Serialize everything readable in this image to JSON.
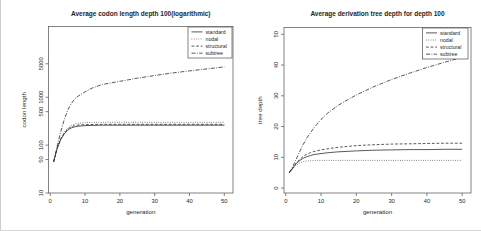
{
  "colors": {
    "line": "#2f2f2f",
    "box": "#5a5a5a",
    "text": "#1f1f1f",
    "background": "#ffffff",
    "frame": "#cccccc"
  },
  "chart_data": [
    {
      "type": "line",
      "title": "Average codon length depth 100(logarithmic)",
      "xlabel": "generation",
      "ylabel": "codon length",
      "x_ticks": [
        0,
        10,
        20,
        30,
        40,
        50
      ],
      "y_ticks": [
        10,
        50,
        100,
        500,
        1000,
        5000
      ],
      "xlim": [
        -0.5,
        52.5
      ],
      "ylim": [
        10,
        30000
      ],
      "y_scale": "log",
      "grid": false,
      "legend_position": "top-right",
      "legend": [
        {
          "label": "standard",
          "linestyle": "solid"
        },
        {
          "label": "nodal",
          "linestyle": "dotted"
        },
        {
          "label": "structural",
          "linestyle": "dashed"
        },
        {
          "label": "subtree",
          "linestyle": "dashdot"
        }
      ],
      "x": [
        1,
        2,
        3,
        4,
        5,
        6,
        7,
        8,
        10,
        12,
        15,
        20,
        25,
        30,
        35,
        40,
        45,
        50
      ],
      "series": [
        {
          "name": "standard",
          "linestyle": "solid",
          "values": [
            45,
            85,
            130,
            170,
            205,
            228,
            240,
            248,
            255,
            258,
            260,
            260,
            260,
            260,
            260,
            260,
            260,
            260
          ]
        },
        {
          "name": "nodal",
          "linestyle": "dotted",
          "values": [
            45,
            88,
            140,
            185,
            225,
            255,
            275,
            285,
            295,
            298,
            300,
            300,
            300,
            300,
            300,
            300,
            300,
            300
          ]
        },
        {
          "name": "structural",
          "linestyle": "dashed",
          "values": [
            45,
            87,
            135,
            178,
            215,
            240,
            255,
            262,
            268,
            270,
            272,
            272,
            272,
            272,
            272,
            272,
            272,
            272
          ]
        },
        {
          "name": "subtree",
          "linestyle": "dashdot",
          "values": [
            45,
            95,
            190,
            340,
            530,
            730,
            915,
            1050,
            1300,
            1550,
            1850,
            2150,
            2500,
            2850,
            3200,
            3550,
            3900,
            4300
          ]
        }
      ]
    },
    {
      "type": "line",
      "title": "Average derivation tree depth for depth 100",
      "xlabel": "generation",
      "ylabel": "tree depth",
      "x_ticks": [
        0,
        10,
        20,
        30,
        40,
        50
      ],
      "y_ticks": [
        0,
        10,
        20,
        30,
        40,
        50
      ],
      "xlim": [
        -0.5,
        52.5
      ],
      "ylim": [
        -1.6,
        52.2
      ],
      "y_scale": "linear",
      "grid": false,
      "legend_position": "top-right",
      "legend": [
        {
          "label": "standard",
          "linestyle": "solid"
        },
        {
          "label": "nodal",
          "linestyle": "dotted"
        },
        {
          "label": "structural",
          "linestyle": "dashed"
        },
        {
          "label": "subtree",
          "linestyle": "dashdot"
        }
      ],
      "x": [
        1,
        2,
        3,
        4,
        5,
        6,
        7,
        8,
        10,
        12,
        15,
        20,
        25,
        30,
        35,
        40,
        45,
        50
      ],
      "series": [
        {
          "name": "standard",
          "linestyle": "solid",
          "values": [
            5,
            6.5,
            8,
            9,
            9.7,
            10.2,
            10.6,
            10.9,
            11.2,
            11.5,
            11.8,
            12.1,
            12.3,
            12.4,
            12.5,
            12.5,
            12.6,
            12.6
          ]
        },
        {
          "name": "nodal",
          "linestyle": "dotted",
          "values": [
            5,
            6.3,
            7.5,
            8.2,
            8.6,
            8.8,
            8.9,
            9,
            9,
            9,
            9,
            9,
            9,
            9,
            9,
            9,
            9,
            9
          ]
        },
        {
          "name": "structural",
          "linestyle": "dashed",
          "values": [
            5,
            6.6,
            8.2,
            9.4,
            10.3,
            11,
            11.5,
            11.9,
            12.4,
            12.8,
            13.3,
            13.8,
            14.1,
            14.3,
            14.4,
            14.5,
            14.6,
            14.6
          ]
        },
        {
          "name": "subtree",
          "linestyle": "dashdot",
          "values": [
            5,
            7,
            9.5,
            12,
            14.3,
            16.3,
            18,
            19.6,
            22.3,
            24.5,
            27,
            30.3,
            33,
            35.3,
            37.3,
            39.2,
            40.9,
            42.5
          ]
        }
      ]
    }
  ]
}
